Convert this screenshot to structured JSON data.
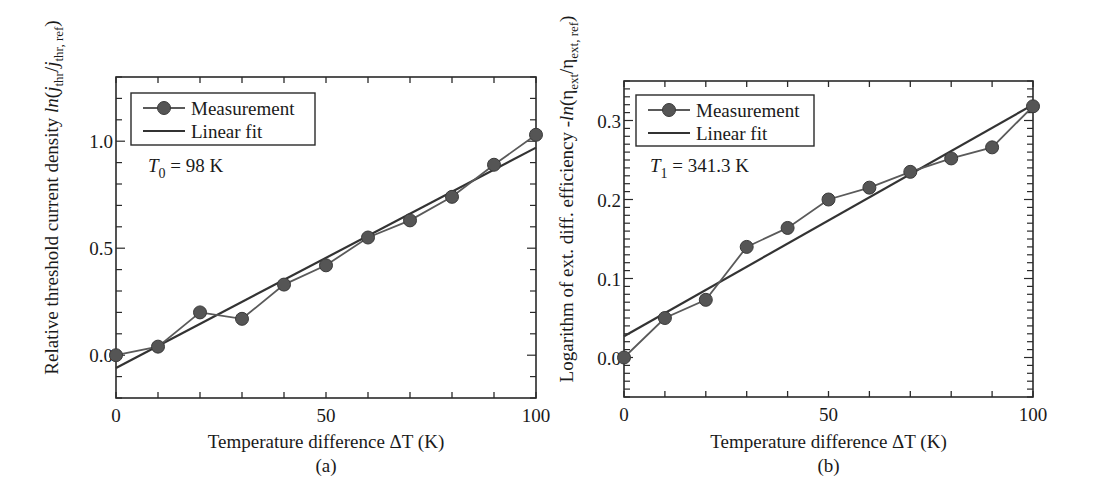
{
  "chart_data": [
    {
      "type": "line",
      "panel": "(a)",
      "title": "",
      "xlabel": "Temperature difference ΔT (K)",
      "ylabel": "Relative threshold current density ln(j_thr/j_thr, ref)",
      "ylabel_parts": {
        "prefix": "Relative threshold current density ",
        "fn": "ln",
        "open": "(",
        "num": "j",
        "num_sub": "thr",
        "slash": "/",
        "den": "j",
        "den_sub": "thr, ref",
        "close": ")"
      },
      "xlim": [
        0,
        100
      ],
      "ylim": [
        -0.2,
        1.3
      ],
      "xticks": [
        0,
        50,
        100
      ],
      "xtick_labels": [
        "0",
        "50",
        "100"
      ],
      "x_minor_step": 10,
      "yticks": [
        0.0,
        0.5,
        1.0
      ],
      "ytick_labels": [
        "0.0",
        "0.5",
        "1.0"
      ],
      "y_minor_step": 0.1,
      "grid": false,
      "legend_position": "upper left",
      "legend": [
        "Measurement",
        "Linear fit"
      ],
      "annotation": {
        "symbol": "T",
        "sub": "0",
        "text": " = 98 K"
      },
      "series": [
        {
          "name": "Measurement",
          "style": "line+marker",
          "x": [
            0,
            10,
            20,
            30,
            40,
            50,
            60,
            70,
            80,
            90,
            100
          ],
          "y": [
            0.0,
            0.04,
            0.2,
            0.17,
            0.33,
            0.42,
            0.55,
            0.63,
            0.74,
            0.89,
            1.03
          ]
        },
        {
          "name": "Linear fit",
          "style": "line",
          "x": [
            0,
            100
          ],
          "y": [
            -0.06,
            0.97
          ]
        }
      ]
    },
    {
      "type": "line",
      "panel": "(b)",
      "title": "",
      "xlabel": "Temperature difference ΔT (K)",
      "ylabel": "Logarithm of ext. diff. efficiency -ln(η_ext/η_ext, ref)",
      "ylabel_parts": {
        "prefix": "Logarithm of ext. diff. efficiency -",
        "fn": "ln",
        "open": "(",
        "num": "η",
        "num_sub": "ext",
        "slash": "/",
        "den": "η",
        "den_sub": "ext, ref",
        "close": ")"
      },
      "xlim": [
        0,
        100
      ],
      "ylim": [
        -0.05,
        0.35
      ],
      "xticks": [
        0,
        50,
        100
      ],
      "xtick_labels": [
        "0",
        "50",
        "100"
      ],
      "x_minor_step": 10,
      "yticks": [
        0.0,
        0.1,
        0.2,
        0.3
      ],
      "ytick_labels": [
        "0.0",
        "0.1",
        "0.2",
        "0.3"
      ],
      "y_minor_step": 0.01,
      "grid": false,
      "legend_position": "upper left",
      "legend": [
        "Measurement",
        "Linear fit"
      ],
      "annotation": {
        "symbol": "T",
        "sub": "1",
        "text": " = 341.3 K"
      },
      "series": [
        {
          "name": "Measurement",
          "style": "line+marker",
          "x": [
            0,
            10,
            20,
            30,
            40,
            50,
            60,
            70,
            80,
            90,
            100
          ],
          "y": [
            0.0,
            0.05,
            0.073,
            0.14,
            0.164,
            0.2,
            0.215,
            0.235,
            0.252,
            0.266,
            0.318
          ]
        },
        {
          "name": "Linear fit",
          "style": "line",
          "x": [
            0,
            100
          ],
          "y": [
            0.027,
            0.32
          ]
        }
      ]
    }
  ],
  "colors": {
    "axes": "#2a2a2a",
    "marker_fill": "#555555",
    "marker_edge": "#3a3a3a",
    "measurement_line": "#5a5a5a",
    "fit_line": "#333333"
  }
}
